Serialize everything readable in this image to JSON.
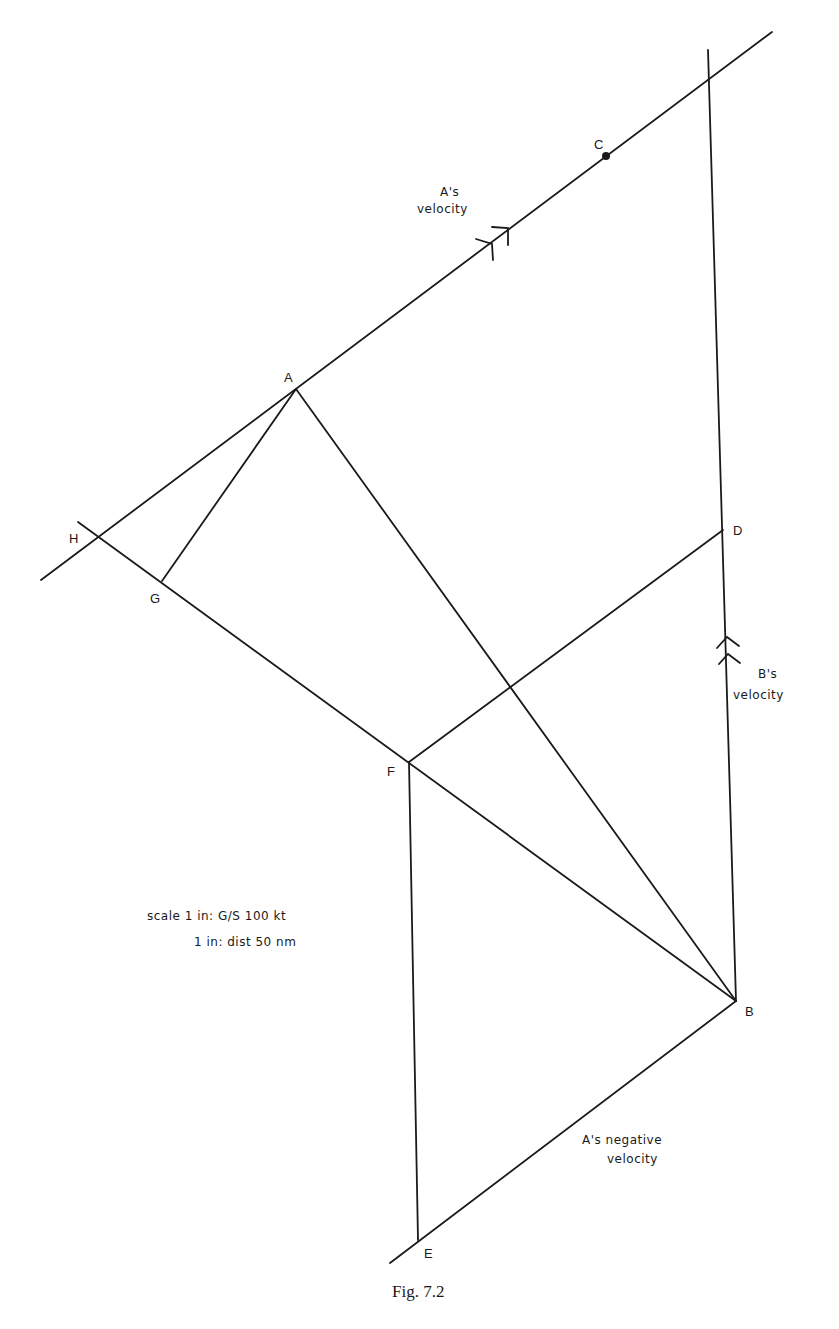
{
  "figure": {
    "caption": "Fig. 7.2",
    "points": {
      "A": "A",
      "B": "B",
      "C": "C",
      "D": "D",
      "E": "E",
      "F": "F",
      "G": "G",
      "H": "H"
    },
    "labels": {
      "a_velocity_line1": "A's",
      "a_velocity_line2": "velocity",
      "b_velocity_line1": "B's",
      "b_velocity_line2": "velocity",
      "a_neg_velocity_line1": "A's negative",
      "a_neg_velocity_line2": "velocity"
    },
    "scale": {
      "line1": "scale 1 in: G/S 100 kt",
      "line2": "1 in: dist 50 nm"
    }
  }
}
